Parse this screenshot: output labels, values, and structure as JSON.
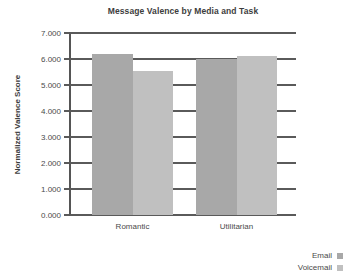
{
  "chart_data": {
    "type": "bar",
    "title": "Message Valence by Media and Task",
    "xlabel": "",
    "ylabel": "Normalized Valence Score",
    "categories": [
      "Romantic",
      "Utilitarian"
    ],
    "series": [
      {
        "name": "Email",
        "values": [
          6.2,
          6.0
        ],
        "color": "#a8a8a8"
      },
      {
        "name": "Voicemail",
        "values": [
          5.55,
          6.12
        ],
        "color": "#c0c0c0"
      }
    ],
    "ylim": [
      0,
      7
    ],
    "ytick_step": 1,
    "ytick_labels": [
      "7.000",
      "6.000",
      "5.000",
      "4.000",
      "3.000",
      "2.000",
      "1.000",
      "0.000"
    ],
    "ytick_values": [
      7,
      6,
      5,
      4,
      3,
      2,
      1,
      0
    ],
    "grid": true,
    "grid_axis": "y",
    "legend_position": "bottom-right",
    "legend_entries": [
      "Email",
      "Voicemail"
    ]
  },
  "axis": {
    "line_color": "#555555",
    "grid_color": "#5a5a5a"
  },
  "background": "#ffffff"
}
